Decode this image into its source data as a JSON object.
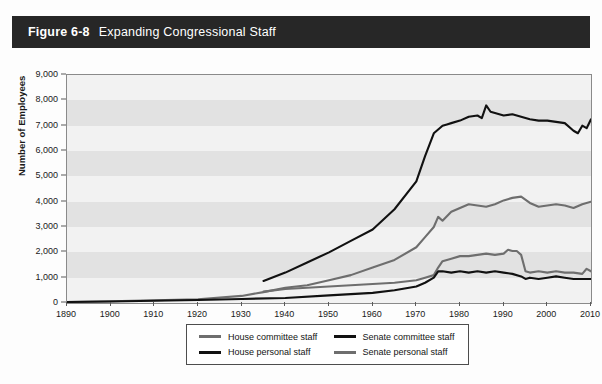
{
  "header": {
    "figure_number": "Figure 6-8",
    "title": "Expanding Congressional Staff"
  },
  "colors": {
    "header_bar": "#272727",
    "plot_background": "#f2f2f2",
    "band": "#e2e2e2",
    "black_series": "#111111",
    "gray_series": "#6e6e6e"
  },
  "chart_data": {
    "type": "line",
    "title": "Expanding Congressional Staff",
    "xlabel": "",
    "ylabel": "Number of Employees",
    "xlim": [
      1890,
      2010
    ],
    "ylim": [
      0,
      9000
    ],
    "grid": "horizontal-bands",
    "legend_position": "bottom",
    "xticks": [
      1890,
      1900,
      1910,
      1920,
      1930,
      1940,
      1950,
      1960,
      1970,
      1980,
      1990,
      2000,
      2010
    ],
    "xtick_labels": [
      "1890",
      "1900",
      "1910",
      "1920",
      "1930",
      "1940",
      "1950",
      "1960",
      "1970",
      "1980",
      "1990",
      "2000",
      "2010"
    ],
    "yticks": [
      0,
      1000,
      2000,
      3000,
      4000,
      5000,
      6000,
      7000,
      8000,
      9000
    ],
    "ytick_labels": [
      "0",
      "1,000",
      "2,000",
      "3,000",
      "4,000",
      "5,000",
      "6,000",
      "7,000",
      "8,000",
      "9,000"
    ],
    "series": [
      {
        "name": "House personal staff",
        "color": "#111111",
        "x": [
          1935,
          1940,
          1945,
          1950,
          1955,
          1960,
          1965,
          1970,
          1972,
          1974,
          1976,
          1977,
          1978,
          1980,
          1982,
          1984,
          1985,
          1986,
          1987,
          1988,
          1990,
          1992,
          1994,
          1995,
          1996,
          1998,
          2000,
          2002,
          2004,
          2006,
          2007,
          2008,
          2009,
          2010
        ],
        "values": [
          870,
          1200,
          1600,
          2000,
          2450,
          2900,
          3700,
          4800,
          5800,
          6700,
          7000,
          7050,
          7100,
          7200,
          7350,
          7400,
          7300,
          7800,
          7550,
          7500,
          7400,
          7450,
          7350,
          7300,
          7250,
          7200,
          7200,
          7150,
          7100,
          6800,
          6700,
          7000,
          6900,
          7250
        ]
      },
      {
        "name": "Senate personal staff",
        "color": "#6e6e6e",
        "x": [
          1890,
          1900,
          1910,
          1920,
          1930,
          1935,
          1940,
          1945,
          1950,
          1955,
          1960,
          1965,
          1970,
          1972,
          1974,
          1975,
          1976,
          1978,
          1980,
          1982,
          1984,
          1986,
          1988,
          1990,
          1992,
          1994,
          1996,
          1998,
          2000,
          2002,
          2004,
          2006,
          2008,
          2010
        ],
        "values": [
          40,
          70,
          110,
          150,
          280,
          430,
          600,
          700,
          900,
          1100,
          1400,
          1700,
          2200,
          2600,
          3000,
          3400,
          3250,
          3600,
          3750,
          3900,
          3850,
          3800,
          3900,
          4050,
          4150,
          4200,
          3950,
          3800,
          3850,
          3900,
          3850,
          3750,
          3900,
          4000
        ]
      },
      {
        "name": "House committee staff",
        "color": "#6e6e6e",
        "x": [
          1935,
          1940,
          1945,
          1950,
          1955,
          1960,
          1965,
          1970,
          1972,
          1974,
          1975,
          1976,
          1978,
          1980,
          1982,
          1984,
          1986,
          1988,
          1990,
          1991,
          1992,
          1993,
          1994,
          1995,
          1996,
          1998,
          2000,
          2002,
          2004,
          2006,
          2008,
          2009,
          2010
        ],
        "values": [
          450,
          550,
          600,
          650,
          700,
          750,
          800,
          900,
          1000,
          1100,
          1400,
          1650,
          1750,
          1850,
          1850,
          1900,
          1950,
          1900,
          1950,
          2100,
          2050,
          2050,
          1900,
          1250,
          1200,
          1250,
          1200,
          1250,
          1200,
          1200,
          1150,
          1350,
          1250
        ]
      },
      {
        "name": "Senate committee staff",
        "color": "#111111",
        "x": [
          1890,
          1900,
          1910,
          1920,
          1930,
          1940,
          1950,
          1955,
          1960,
          1965,
          1970,
          1972,
          1974,
          1975,
          1976,
          1978,
          1980,
          1982,
          1984,
          1986,
          1988,
          1990,
          1992,
          1994,
          1995,
          1996,
          1998,
          2000,
          2002,
          2004,
          2006,
          2008,
          2010
        ],
        "values": [
          40,
          60,
          90,
          120,
          160,
          200,
          300,
          350,
          400,
          500,
          650,
          800,
          1000,
          1250,
          1250,
          1200,
          1250,
          1200,
          1250,
          1200,
          1250,
          1200,
          1150,
          1050,
          950,
          1000,
          950,
          1000,
          1050,
          1000,
          950,
          950,
          950
        ]
      }
    ]
  },
  "legend": {
    "items": [
      {
        "label": "House committee staff",
        "color": "#6e6e6e"
      },
      {
        "label": "Senate committee staff",
        "color": "#111111"
      },
      {
        "label": "House personal staff",
        "color": "#111111"
      },
      {
        "label": "Senate personal staff",
        "color": "#6e6e6e"
      }
    ]
  }
}
